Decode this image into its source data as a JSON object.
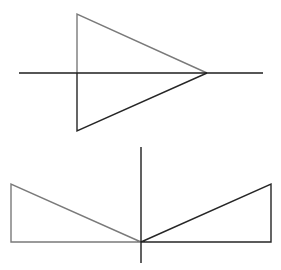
{
  "diagram": {
    "colors": {
      "background": "#ffffff",
      "original_shape": "#7a7a7a",
      "reflected_shape": "#262626",
      "axis": "#1e1e1e"
    },
    "figure_1": {
      "axis": {
        "orientation": "horizontal",
        "x1": 19,
        "y1": 73,
        "x2": 263,
        "y2": 73
      },
      "original_triangle": {
        "points": [
          [
            77,
            14
          ],
          [
            207,
            73
          ],
          [
            77,
            73
          ]
        ]
      },
      "reflected_triangle": {
        "points": [
          [
            77,
            73
          ],
          [
            207,
            73
          ],
          [
            77,
            131
          ]
        ]
      }
    },
    "figure_2": {
      "axis": {
        "orientation": "vertical",
        "x1": 141,
        "y1": 147,
        "x2": 141,
        "y2": 263
      },
      "original_triangle": {
        "points": [
          [
            11,
            184
          ],
          [
            141,
            242
          ],
          [
            11,
            242
          ]
        ]
      },
      "reflected_triangle": {
        "points": [
          [
            271,
            184
          ],
          [
            141,
            242
          ],
          [
            271,
            242
          ]
        ]
      }
    }
  }
}
